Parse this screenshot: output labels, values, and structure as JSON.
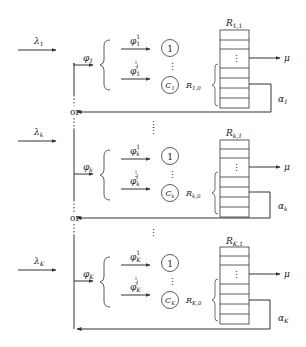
{
  "diagram": {
    "type": "queueing-system",
    "shared": {
      "or_label": "or",
      "service_rate_label": "μ"
    },
    "blocks": [
      {
        "id": "1",
        "arrival_label": "λ",
        "arrival_sub": "1",
        "phi_label": "φ",
        "phi_sub": "1",
        "phi_first_sup": "1",
        "phi_first_sub": "1",
        "phi_last_sup": "l",
        "phi_last_sub": "1",
        "server_first": "1",
        "server_last": "C",
        "server_last_sub": "1",
        "buffer_top_label": "R",
        "buffer_top_sub": "1,1",
        "buffer_bottom_label": "R",
        "buffer_bottom_sub": "1,0",
        "alpha_label": "α",
        "alpha_sub": "1"
      },
      {
        "id": "k",
        "arrival_label": "λ",
        "arrival_sub": "k",
        "phi_label": "φ",
        "phi_sub": "k",
        "phi_first_sup": "1",
        "phi_first_sub": "k",
        "phi_last_sup": "l",
        "phi_last_sub": "k",
        "server_first": "1",
        "server_last": "C",
        "server_last_sub": "k",
        "buffer_top_label": "R",
        "buffer_top_sub": "k,1",
        "buffer_bottom_label": "R",
        "buffer_bottom_sub": "k,0",
        "alpha_label": "α",
        "alpha_sub": "k"
      },
      {
        "id": "K",
        "arrival_label": "λ",
        "arrival_sub": "K",
        "phi_label": "φ",
        "phi_sub": "K",
        "phi_first_sup": "1",
        "phi_first_sub": "K",
        "phi_last_sup": "l",
        "phi_last_sub": "K",
        "server_first": "1",
        "server_last": "C",
        "server_last_sub": "K",
        "buffer_top_label": "R",
        "buffer_top_sub": "K,1",
        "buffer_bottom_label": "R",
        "buffer_bottom_sub": "K,0",
        "alpha_label": "α",
        "alpha_sub": "K"
      }
    ]
  }
}
